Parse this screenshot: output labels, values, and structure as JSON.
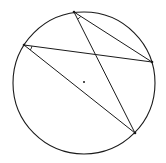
{
  "diagram": {
    "type": "geometry",
    "stroke_color": "#1a1a1a",
    "background": "#ffffff",
    "circle": {
      "cx": 84,
      "cy": 83,
      "r": 71
    },
    "center_dot": {
      "x": 84,
      "y": 82,
      "r": 1
    },
    "points": {
      "A": {
        "x": 74,
        "y": 12
      },
      "B": {
        "x": 24,
        "y": 45
      },
      "C": {
        "x": 152,
        "y": 62
      },
      "D": {
        "x": 135,
        "y": 133
      }
    },
    "chords": [
      {
        "from": "A",
        "to": "C"
      },
      {
        "from": "A",
        "to": "D"
      },
      {
        "from": "B",
        "to": "C"
      },
      {
        "from": "B",
        "to": "D"
      }
    ],
    "angle_marks": [
      {
        "vertex": "A",
        "between": [
          "C",
          "D"
        ],
        "radius": 8
      },
      {
        "vertex": "B",
        "between": [
          "C",
          "D"
        ],
        "radius": 8
      }
    ]
  }
}
